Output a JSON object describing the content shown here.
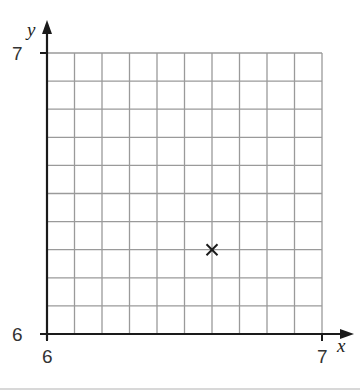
{
  "chart_data": {
    "type": "scatter",
    "title": "",
    "xlabel": "x",
    "ylabel": "y",
    "xlim": [
      6,
      7
    ],
    "ylim": [
      6,
      7
    ],
    "grid": true,
    "grid_divisions": {
      "x": 10,
      "y": 10
    },
    "x_ticks": [
      {
        "value": 6,
        "label": "6"
      },
      {
        "value": 7,
        "label": "7"
      }
    ],
    "y_ticks": [
      {
        "value": 6,
        "label": "6"
      },
      {
        "value": 7,
        "label": "7"
      }
    ],
    "series": [
      {
        "name": "point",
        "marker": "x",
        "points": [
          {
            "x": 6.6,
            "y": 6.3
          }
        ]
      }
    ]
  },
  "axes": {
    "x_label": "x",
    "y_label": "y",
    "x_min_label": "6",
    "x_max_label": "7",
    "y_min_label": "6",
    "y_max_label": "7"
  },
  "colors": {
    "grid": "#9a9a9a",
    "axis": "#1a1a1a",
    "marker": "#1a1a1a"
  }
}
